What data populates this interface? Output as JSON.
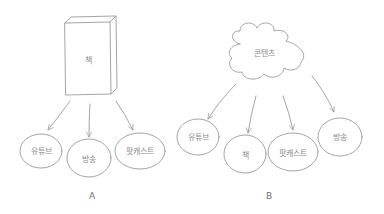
{
  "diagram": {
    "colors": {
      "stroke": "#9a9a9a",
      "text": "#8a8a8a",
      "background": "#ffffff"
    },
    "panel_a": {
      "caption": "A",
      "source": {
        "shape": "book",
        "label": "책"
      },
      "targets": [
        {
          "label": "유튜브"
        },
        {
          "label": "방송"
        },
        {
          "label": "팟캐스트"
        }
      ]
    },
    "panel_b": {
      "caption": "B",
      "source": {
        "shape": "cloud",
        "label": "콘텐츠"
      },
      "targets": [
        {
          "label": "유튜브"
        },
        {
          "label": "책"
        },
        {
          "label": "팟캐스트"
        },
        {
          "label": "방송"
        }
      ]
    }
  }
}
